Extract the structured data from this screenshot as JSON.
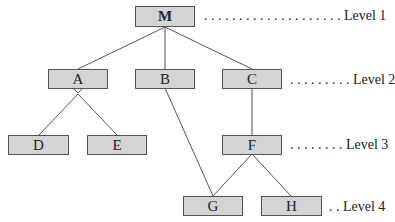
{
  "nodes": {
    "M": {
      "label": "M"
    },
    "A": {
      "label": "A"
    },
    "B": {
      "label": "B"
    },
    "C": {
      "label": "C"
    },
    "D": {
      "label": "D"
    },
    "E": {
      "label": "E"
    },
    "F": {
      "label": "F"
    },
    "G": {
      "label": "G"
    },
    "H": {
      "label": "H"
    }
  },
  "edges": [
    [
      "M",
      "A"
    ],
    [
      "M",
      "B"
    ],
    [
      "M",
      "C"
    ],
    [
      "A",
      "D"
    ],
    [
      "A",
      "E"
    ],
    [
      "B",
      "G"
    ],
    [
      "C",
      "F"
    ],
    [
      "F",
      "G"
    ],
    [
      "F",
      "H"
    ]
  ],
  "levels": {
    "l1": ". . . . . . . . . . . . . . . . . . . . Level 1",
    "l2": ". . . . . . . . . Level 2",
    "l3": ". . . . . . . . Level 3",
    "l4": ". . Level 4"
  }
}
